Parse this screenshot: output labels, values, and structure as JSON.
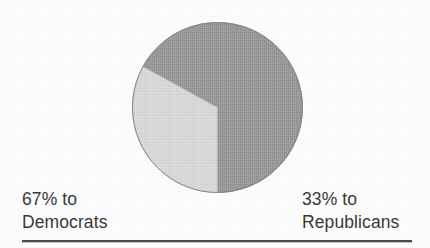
{
  "figure": {
    "background_color": "#fdfdfd",
    "text_color": "#38383a",
    "rule_color": "#4a4a4c"
  },
  "labels": {
    "left": {
      "line1": "67% to",
      "line2": "Democrats"
    },
    "right": {
      "line1": "33% to",
      "line2": "Republicans"
    }
  },
  "chart_data": {
    "type": "pie",
    "title": "",
    "subtitle": "",
    "xlabel": "",
    "ylabel": "",
    "grid": false,
    "legend_position": "below-left-and-below-right",
    "labels": [
      "Democrats",
      "Republicans"
    ],
    "values": [
      67,
      33
    ],
    "value_unit": "percent",
    "value_labels": [
      "67%",
      "33%"
    ],
    "annotations": [
      "67% to Democrats",
      "33% to Republicans"
    ],
    "colors": [
      "#9a9a9a",
      "#d8d8d8"
    ],
    "slice_edge_color": "#6f6f71",
    "start_angle_deg": 180,
    "direction": "counterclockwise",
    "center_px": [
      85.5,
      85.5
    ],
    "radius_px": 85,
    "slices": [
      {
        "name": "Democrats",
        "value": 67,
        "display_value": "67%",
        "color": "#9a9a9a",
        "fill_style": "dark-dither"
      },
      {
        "name": "Republicans",
        "value": 33,
        "display_value": "33%",
        "color": "#d8d8d8",
        "fill_style": "light-dither"
      }
    ]
  }
}
